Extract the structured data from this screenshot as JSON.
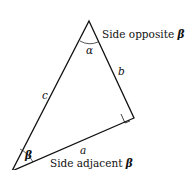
{
  "diagram": {
    "type": "right-triangle",
    "vertices": {
      "top": [
        89,
        21
      ],
      "right": [
        134,
        118
      ],
      "bottom_left": [
        12,
        171
      ]
    },
    "labels": {
      "opposite_text": "Side opposite ",
      "adjacent_text": "Side adjacent ",
      "beta": "β",
      "alpha": "α",
      "side_a": "a",
      "side_b": "b",
      "side_c": "c"
    },
    "stroke_color": "#111111"
  }
}
